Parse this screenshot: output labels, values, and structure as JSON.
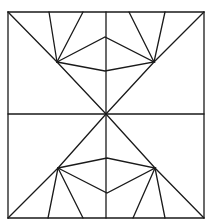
{
  "diagram": {
    "title": "",
    "stroke_color": "#1a1a1a",
    "background": "#ffffff",
    "square": {
      "x1": 8,
      "y1": 12,
      "x2": 204,
      "y2": 218
    },
    "center": {
      "x": 106,
      "y": 114
    }
  }
}
